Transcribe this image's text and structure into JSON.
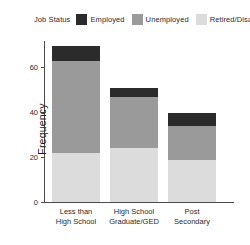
{
  "legend": {
    "title": "Job Status",
    "entries": [
      {
        "label": "Employed",
        "color": "#2b2b2b"
      },
      {
        "label": "Unemployed",
        "color": "#9a9a9a"
      },
      {
        "label": "Retired/Disabled",
        "color": "#dcdcdc"
      }
    ]
  },
  "axes": {
    "y_title": "Frequency",
    "y_ticks": [
      "0",
      "20",
      "40",
      "60"
    ],
    "x_tick_lines": [
      [
        "Less than",
        "High School"
      ],
      [
        "High School",
        "Graduate/GED"
      ],
      [
        "Post",
        "Secondary"
      ]
    ]
  },
  "chart_data": {
    "type": "bar",
    "title": "",
    "xlabel": "",
    "ylabel": "Frequency",
    "ylim": [
      0,
      72
    ],
    "yticks": [
      0,
      20,
      40,
      60
    ],
    "grid": false,
    "stacked": true,
    "legend_position": "top",
    "legend_title": "Job Status",
    "categories": [
      "Less than High School",
      "High School Graduate/GED",
      "Post Secondary"
    ],
    "series": [
      {
        "name": "Employed",
        "color": "#2b2b2b",
        "values": [
          7,
          4,
          6
        ]
      },
      {
        "name": "Unemployed",
        "color": "#9a9a9a",
        "values": [
          41,
          23,
          15
        ]
      },
      {
        "name": "Retired/Disabled",
        "color": "#dcdcdc",
        "values": [
          22,
          24,
          19
        ]
      }
    ],
    "totals": [
      70,
      51,
      40
    ]
  }
}
